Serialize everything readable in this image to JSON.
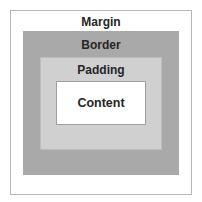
{
  "diagram": {
    "layers": [
      {
        "name": "margin",
        "label": "Margin",
        "color": "#ffffff"
      },
      {
        "name": "border",
        "label": "Border",
        "color": "#a9a9a9"
      },
      {
        "name": "padding",
        "label": "Padding",
        "color": "#d0d0d0"
      },
      {
        "name": "content",
        "label": "Content",
        "color": "#ffffff"
      }
    ]
  }
}
